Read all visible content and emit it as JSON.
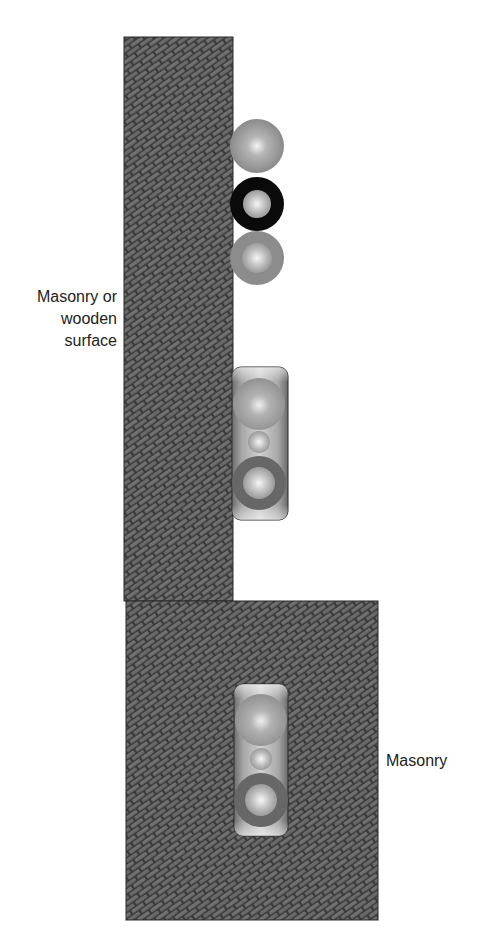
{
  "diagram": {
    "title": "",
    "labels": {
      "upper_wall": [
        "Masonry or",
        "wooden",
        "surface"
      ],
      "lower_wall": "Masonry"
    },
    "colors": {
      "brick_fill": "#6e6e6e",
      "mortar": "#3a3a3a",
      "outline": "#2a2a2a",
      "gray_circle": "#8c8c8c",
      "black_ring": "#0a0a0a",
      "dark_ring": "#676767",
      "highlight": "#f2f2f2",
      "housing": "#9a9a9a",
      "text": "#222222"
    },
    "elements": [
      {
        "id": "upper-wall",
        "type": "masonry-panel",
        "x": 124,
        "y": 37,
        "w": 109,
        "h": 564
      },
      {
        "id": "lower-wall",
        "type": "masonry-panel",
        "x": 126,
        "y": 601,
        "w": 252,
        "h": 319
      },
      {
        "id": "standalone-circle-top",
        "type": "gray-circle",
        "cx": 257,
        "cy": 146,
        "r": 27
      },
      {
        "id": "standalone-ring-black",
        "type": "black-ring",
        "cx": 257,
        "cy": 204,
        "r": 27,
        "inner_r": 14
      },
      {
        "id": "standalone-circle-bottom",
        "type": "gray-ring",
        "cx": 257,
        "cy": 258,
        "r": 27,
        "inner_r": 14
      },
      {
        "id": "mounted-unit-upper",
        "type": "housing",
        "x": 232,
        "y": 367,
        "w": 56,
        "h": 153,
        "parts": [
          {
            "type": "large-circle",
            "cy": 404,
            "r": 27
          },
          {
            "type": "small-circle",
            "cy": 442,
            "r": 11
          },
          {
            "type": "dark-ring",
            "cy": 483,
            "r": 27,
            "inner_r": 16
          }
        ]
      },
      {
        "id": "mounted-unit-lower",
        "type": "housing",
        "x": 234,
        "y": 684,
        "w": 54,
        "h": 152,
        "parts": [
          {
            "type": "large-circle",
            "cy": 720,
            "r": 27
          },
          {
            "type": "small-circle",
            "cy": 759,
            "r": 11
          },
          {
            "type": "dark-ring",
            "cy": 800,
            "r": 27,
            "inner_r": 16
          }
        ]
      }
    ]
  }
}
